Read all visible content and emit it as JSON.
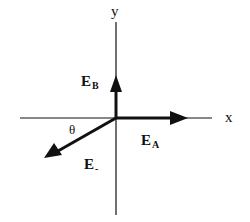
{
  "diagram": {
    "type": "vector-diagram",
    "axes": {
      "x_label": "x",
      "y_label": "y"
    },
    "vectors": [
      {
        "id": "E_A",
        "main": "E",
        "sub": "A",
        "direction": "positive-x"
      },
      {
        "id": "E_B",
        "main": "E",
        "sub": "B",
        "direction": "positive-y"
      },
      {
        "id": "E_minus",
        "main": "E",
        "sub": "-",
        "direction": "lower-left"
      }
    ],
    "angle_label": "θ",
    "colors": {
      "stroke": "#111111",
      "background": "#ffffff"
    }
  }
}
